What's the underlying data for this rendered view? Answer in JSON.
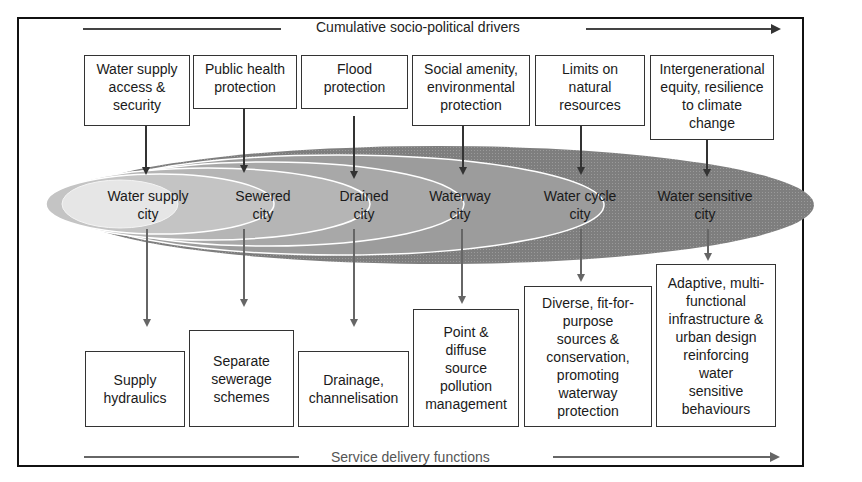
{
  "diagram": {
    "top_label": "Cumulative socio-political drivers",
    "bottom_label": "Service delivery functions",
    "drivers": [
      {
        "label": "Water supply\naccess &\nsecurity"
      },
      {
        "label": "Public health\nprotection"
      },
      {
        "label": "Flood\nprotection"
      },
      {
        "label": "Social amenity,\nenvironmental\nprotection"
      },
      {
        "label": "Limits on\nnatural\nresources"
      },
      {
        "label": "Intergenerational\nequity, resilience\nto climate\nchange"
      }
    ],
    "cities": [
      {
        "label": "Water supply\ncity"
      },
      {
        "label": "Sewered\ncity"
      },
      {
        "label": "Drained\ncity"
      },
      {
        "label": "Waterway\ncity"
      },
      {
        "label": "Water cycle\ncity"
      },
      {
        "label": "Water sensitive\ncity"
      }
    ],
    "functions": [
      {
        "label": "Supply\nhydraulics"
      },
      {
        "label": "Separate\nsewerage\nschemes"
      },
      {
        "label": "Drainage,\nchannelisation"
      },
      {
        "label": "Point &\ndiffuse\nsource\npollution\nmanagement"
      },
      {
        "label": "Diverse, fit-for-\npurpose\nsources &\nconservation,\npromoting\nwaterway\nprotection"
      },
      {
        "label": "Adaptive, multi-\nfunctional\ninfrastructure &\nurban design\nreinforcing\nwater\nsensitive\nbehaviours"
      }
    ],
    "colors": {
      "frame": "#111111",
      "ellipse_outer": "#8a8a8a",
      "ellipse_light": "#e8e8e8",
      "ring_line": "#ffffff"
    }
  }
}
